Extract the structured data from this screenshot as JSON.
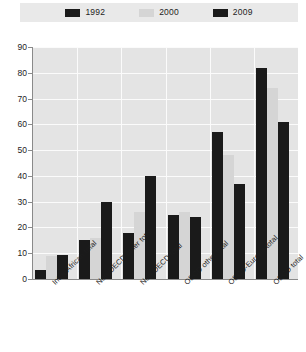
{
  "legend": {
    "entries": [
      {
        "label": "1992",
        "color": "#1a1a1a",
        "icon": "legend-swatch-icon"
      },
      {
        "label": "2000",
        "color": "#d5d5d5",
        "icon": "legend-swatch-icon"
      },
      {
        "label": "2009",
        "color": "#1a1a1a",
        "icon": "legend-swatch-icon"
      }
    ]
  },
  "axis": {
    "y_ticks": [
      "90",
      "80",
      "70",
      "60",
      "50",
      "40",
      "30",
      "20",
      "10",
      "0"
    ]
  },
  "chart_data": {
    "type": "bar",
    "title": "",
    "xlabel": "",
    "ylabel": "",
    "ylim": [
      0,
      90
    ],
    "grid": true,
    "legend_position": "top",
    "categories": [
      "Intra-African total",
      "Non-OECD other total",
      "Non-OECD total",
      "OECD other total",
      "OECD-Europe total",
      "OECD total"
    ],
    "series": [
      {
        "name": "1992",
        "color": "#1a1a1a",
        "values": [
          3.5,
          15,
          18,
          25,
          57,
          82
        ]
      },
      {
        "name": "2000",
        "color": "#d5d5d5",
        "values": [
          9,
          16,
          26,
          26,
          48,
          74
        ]
      },
      {
        "name": "2009",
        "color": "#1a1a1a",
        "values": [
          9.5,
          30,
          40,
          24,
          37,
          61
        ]
      }
    ]
  }
}
